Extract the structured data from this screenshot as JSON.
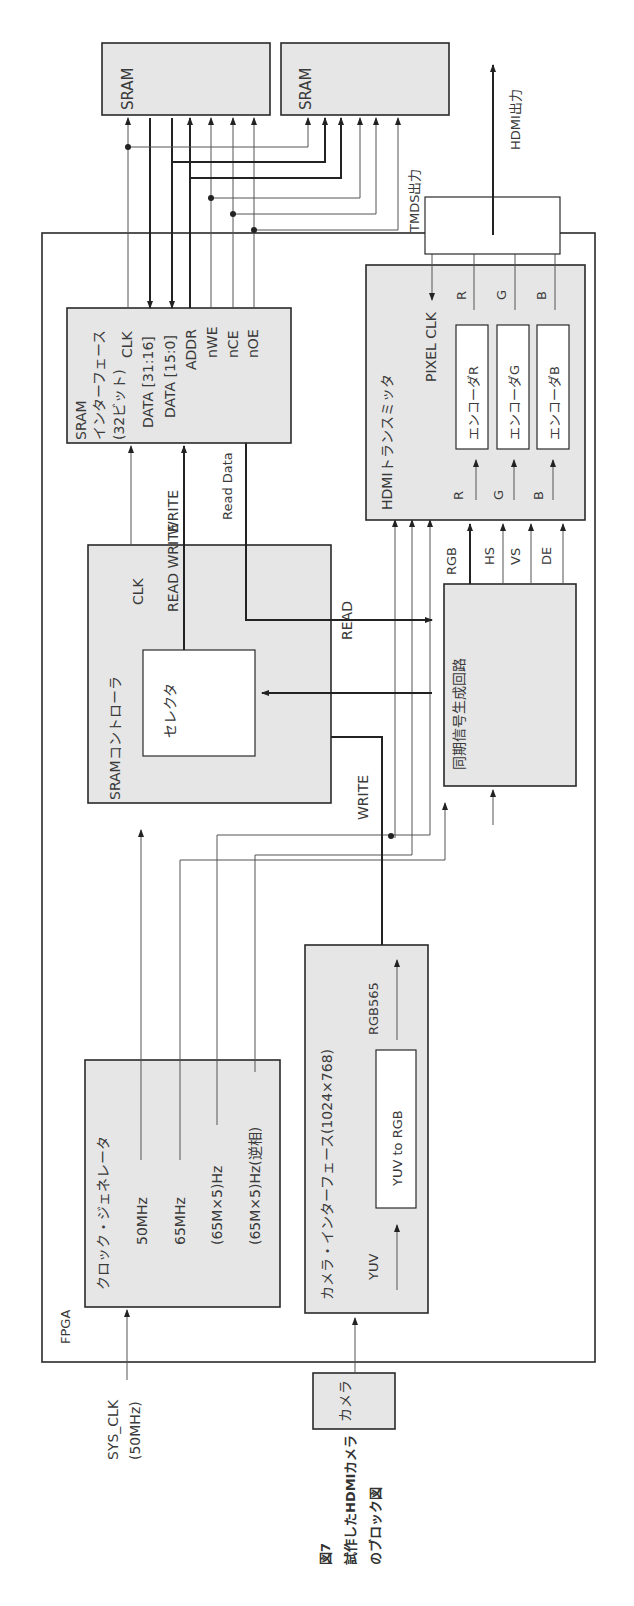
{
  "caption": {
    "figure_no": "図7",
    "line1": "試作したHDMIカメラ",
    "line2": "のブロック図"
  },
  "fpga": {
    "label": "FPGA"
  },
  "external": {
    "sys_clk": "SYS_CLK",
    "sys_clk_freq": "(50MHz)",
    "camera": "カメラ",
    "sram1": "SRAM",
    "sram2": "SRAM",
    "tmds_out": "TMDS出力",
    "hdmi_out": "HDMI出力"
  },
  "clock_generator": {
    "title": "クロック・ジェネレータ",
    "outputs": [
      "50MHz",
      "65MHz",
      "(65M×5)Hz",
      "(65M×5)Hz(逆相)"
    ]
  },
  "camera_interface": {
    "title": "カメラ・インターフェース(1024×768)",
    "input": "YUV",
    "converter": "YUV to RGB",
    "output": "RGB565"
  },
  "sram_controller": {
    "title": "SRAMコントローラ",
    "selector": "セレクタ",
    "clk": "CLK",
    "read_write": "READ WRITE"
  },
  "sram_interface": {
    "title1": "SRAM",
    "title2": "インターフェース",
    "title3": "(32ビット)",
    "pins": [
      "CLK",
      "DATA [31:16]",
      "DATA [15:0]",
      "ADDR",
      "nWE",
      "nCE",
      "nOE"
    ]
  },
  "signals": {
    "write": "WRITE",
    "read": "READ",
    "read_data": "Read Data",
    "write_top": "WRITE"
  },
  "sync_generator": {
    "title": "同期信号生成回路",
    "outputs": [
      "RGB",
      "HS",
      "VS",
      "DE"
    ]
  },
  "hdmi_transmitter": {
    "title": "HDMIトランスミッタ",
    "pixel_clk": "PIXEL CLK",
    "inputs": [
      "R",
      "G",
      "B"
    ],
    "outputs": [
      "R",
      "G",
      "B"
    ],
    "encoders": [
      "エンコーダR",
      "エンコーダG",
      "エンコーダB"
    ]
  }
}
